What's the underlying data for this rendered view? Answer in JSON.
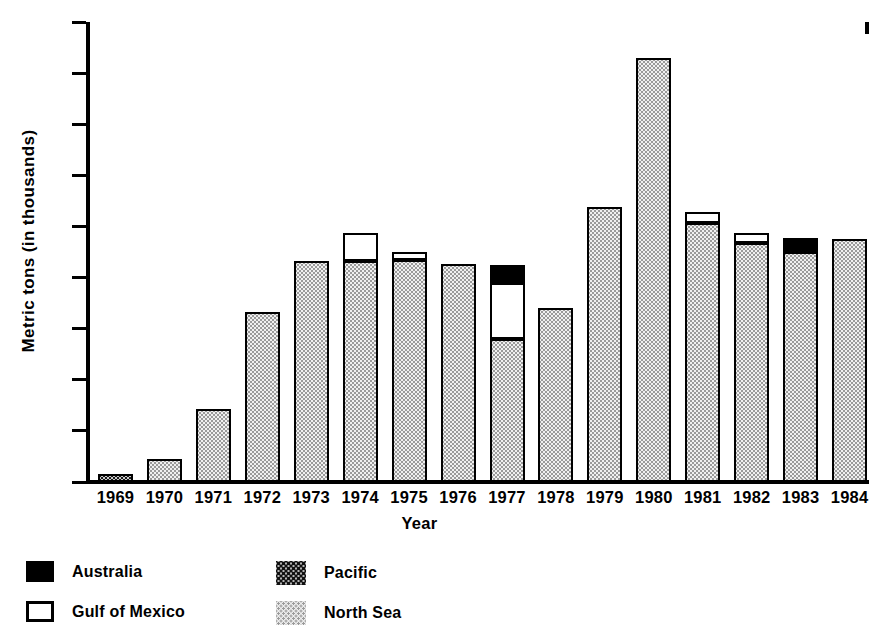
{
  "chart_data": {
    "type": "bar",
    "title": "",
    "subtitle": "",
    "xlabel": "Year",
    "ylabel": "Metric tons (in thousands)",
    "stacked": true,
    "grid": false,
    "legend_position": "bottom-left",
    "ylim": [
      0,
      180
    ],
    "yticks": [
      0,
      20,
      40,
      60,
      80,
      100,
      120,
      140,
      160,
      180
    ],
    "ytick_labels": [
      "0",
      "20",
      "40",
      "60",
      "80",
      "100",
      "120",
      "140",
      "160",
      "180"
    ],
    "categories": [
      "1969",
      "1970",
      "1971",
      "1972",
      "1973",
      "1974",
      "1975",
      "1976",
      "1977",
      "1978",
      "1979",
      "1980",
      "1981",
      "1982",
      "1983",
      "1984"
    ],
    "series": [
      {
        "name": "North Sea",
        "fill": "light-dots",
        "color": "#f0f0f0",
        "values": [
          0,
          9,
          28.5,
          66.5,
          86.5,
          86.5,
          87,
          85.5,
          56,
          68,
          107.5,
          166,
          101.5,
          93.5,
          90,
          95
        ]
      },
      {
        "name": "Pacific",
        "fill": "dark-dots",
        "color": "#c9c9c9",
        "values": [
          3,
          0,
          0,
          0,
          0,
          0,
          0,
          0,
          0,
          0,
          0,
          0,
          0,
          0,
          0,
          0
        ]
      },
      {
        "name": "Gulf of Mexico",
        "fill": "white",
        "color": "#ffffff",
        "values": [
          0,
          0,
          0,
          0,
          0,
          11,
          3,
          0,
          22,
          0,
          0,
          0,
          4,
          4,
          0,
          0
        ]
      },
      {
        "name": "Australia",
        "fill": "black",
        "color": "#000000",
        "values": [
          0,
          0,
          0,
          0,
          0,
          0,
          0,
          0,
          7,
          0,
          0,
          0,
          0,
          0,
          5.5,
          0
        ]
      }
    ],
    "totals": [
      3,
      9,
      28.5,
      66.5,
      86.5,
      97.5,
      90,
      85.5,
      85,
      68,
      107.5,
      166,
      105.5,
      97.5,
      95.5,
      95
    ]
  },
  "legend": {
    "items": [
      {
        "label": "Australia",
        "swatch": "australia"
      },
      {
        "label": "Pacific",
        "swatch": "pacific"
      },
      {
        "label": "Gulf of Mexico",
        "swatch": "gulf"
      },
      {
        "label": "North Sea",
        "swatch": "northsea"
      }
    ]
  }
}
